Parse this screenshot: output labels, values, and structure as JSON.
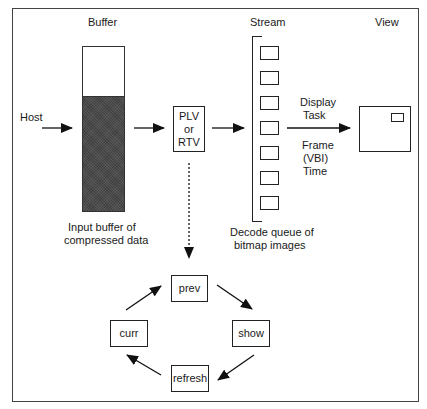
{
  "diagram": {
    "headers": {
      "buffer": "Buffer",
      "stream": "Stream",
      "view": "View"
    },
    "host_label": "Host",
    "buffer_caption": [
      "Input buffer of",
      "compressed data"
    ],
    "decoder_box": [
      "PLV",
      "or",
      "RTV"
    ],
    "queue_caption": [
      "Decode queue of",
      "bitmap images"
    ],
    "queue_slot_count": 7,
    "display_task_label": [
      "Display",
      "Task"
    ],
    "frame_time_label": [
      "Frame",
      "(VBI)",
      "Time"
    ],
    "cycle": {
      "prev": "prev",
      "show": "show",
      "refresh": "refresh",
      "curr": "curr"
    },
    "edges": [
      {
        "from": "Host",
        "to": "Buffer",
        "style": "solid"
      },
      {
        "from": "Buffer",
        "to": "PLV or RTV",
        "style": "solid"
      },
      {
        "from": "PLV or RTV",
        "to": "Stream",
        "style": "solid"
      },
      {
        "from": "Stream",
        "to": "View",
        "style": "solid",
        "label": "Display Task / Frame (VBI) Time"
      },
      {
        "from": "PLV or RTV",
        "to": "prev",
        "style": "dashed"
      },
      {
        "from": "prev",
        "to": "show",
        "style": "solid"
      },
      {
        "from": "show",
        "to": "refresh",
        "style": "solid"
      },
      {
        "from": "refresh",
        "to": "curr",
        "style": "solid"
      },
      {
        "from": "curr",
        "to": "prev",
        "style": "solid"
      }
    ]
  }
}
